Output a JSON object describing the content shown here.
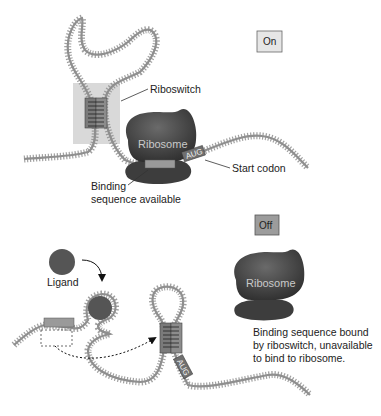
{
  "diagram": {
    "on_panel": {
      "state_label": "On",
      "riboswitch_label": "Riboswitch",
      "ribosome_label": "Ribosome",
      "start_codon_tag": "AUG",
      "start_codon_label": "Start codon",
      "binding_label_line1": "Binding",
      "binding_label_line2": "sequence available"
    },
    "off_panel": {
      "state_label": "Off",
      "ligand_label": "Ligand",
      "ribosome_label": "Ribosome",
      "start_codon_tag": "AUG",
      "note_line1": "Binding sequence bound",
      "note_line2": "by riboswitch, unavailable",
      "note_line3": "to bind to ribosome."
    },
    "colors": {
      "rna_strand": "#8f8f8f",
      "riboswitch_highlight": "#d9d9d9",
      "stem_box": "#7a7a7a",
      "binding_box": "#9a9a9a",
      "ribosome": "#4a4a4a",
      "ligand": "#555555",
      "on_box_fill": "#e6e6e6",
      "off_box_fill": "#9c9c9c"
    }
  }
}
